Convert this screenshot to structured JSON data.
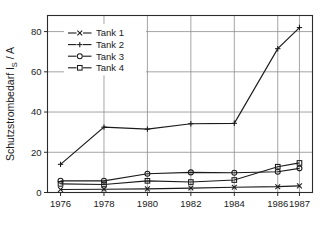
{
  "chart_data": {
    "type": "line",
    "title": "",
    "xlabel": "",
    "ylabel": "Schutzstrombedarf I",
    "ylabel_sub": "S",
    "ylabel_unit": " / A",
    "ylabel_full": "Schutzstrombedarf I_S / A",
    "categories": [
      "1976",
      "1978",
      "1980",
      "1982",
      "1984",
      "1986",
      "1987"
    ],
    "x": [
      1976,
      1978,
      1980,
      1982,
      1984,
      1986,
      1987
    ],
    "xlim": [
      1975.4,
      1987.6
    ],
    "ylim": [
      0,
      88
    ],
    "yticks": [
      0,
      20,
      40,
      60,
      80
    ],
    "ytick_labels": [
      "0",
      "20",
      "40",
      "60",
      "80"
    ],
    "xticks": [
      1976,
      1978,
      1980,
      1982,
      1984,
      1986,
      1987
    ],
    "grid": true,
    "grid_axis": "both",
    "legend_position": "upper left",
    "series": [
      {
        "name": "Tank 1",
        "marker": "x",
        "values": [
          1.5,
          1.6,
          1.8,
          2.2,
          2.6,
          2.9,
          3.3
        ]
      },
      {
        "name": "Tank 2",
        "marker": "+",
        "values": [
          14.0,
          32.5,
          31.5,
          34.2,
          34.4,
          71.5,
          82.0
        ]
      },
      {
        "name": "Tank 3",
        "marker": "circle",
        "values": [
          5.8,
          5.8,
          9.3,
          10.0,
          9.8,
          10.3,
          12.0
        ]
      },
      {
        "name": "Tank 4",
        "marker": "square",
        "values": [
          4.3,
          4.0,
          5.8,
          5.2,
          6.2,
          12.8,
          14.7
        ]
      }
    ]
  },
  "legend": {
    "entries": [
      {
        "label": "Tank 1",
        "marker": "x"
      },
      {
        "label": "Tank 2",
        "marker": "+"
      },
      {
        "label": "Tank 3",
        "marker": "circle"
      },
      {
        "label": "Tank 4",
        "marker": "square"
      }
    ]
  },
  "colors": {
    "ink": "#1a1a1a",
    "grid": "#8e8e8e",
    "background": "#ffffff"
  },
  "caption": ""
}
